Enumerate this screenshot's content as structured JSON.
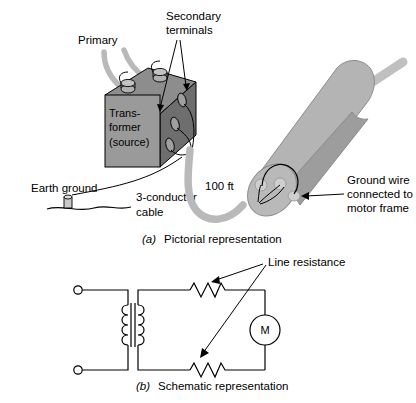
{
  "figure": {
    "panel_a": {
      "caption_index": "(a)",
      "caption_text": "Pictorial representation",
      "labels": {
        "primary": "Primary",
        "secondary_terminals_line1": "Secondary",
        "secondary_terminals_line2": "terminals",
        "transformer_line1": "Trans-",
        "transformer_line2": "former",
        "transformer_line3": "(source)",
        "earth_ground": "Earth ground",
        "cable_line1": "3-conductor",
        "cable_line2": "cable",
        "distance": "100 ft",
        "ground_wire_line1": "Ground wire",
        "ground_wire_line2": "connected to",
        "ground_wire_line3": "motor frame"
      }
    },
    "panel_b": {
      "caption_index": "(b)",
      "caption_text": "Schematic representation",
      "labels": {
        "line_resistance": "Line resistance",
        "motor_symbol": "M"
      }
    }
  },
  "colors": {
    "stroke": "#000000",
    "box_front": "#9a9a9a",
    "box_top": "#8d8d8d",
    "box_side": "#6e6e6e",
    "motor_body": "#b4b4b4",
    "motor_shadow": "#9d9d9d",
    "cable_gray": "#b9b9b9",
    "background": "#ffffff"
  }
}
